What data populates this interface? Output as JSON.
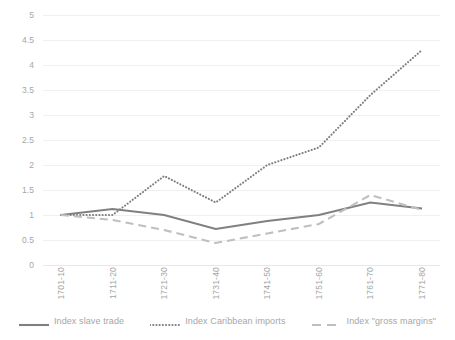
{
  "chart_data": {
    "type": "line",
    "title": "",
    "xlabel": "",
    "ylabel": "",
    "categories": [
      "1701-10",
      "1711-20",
      "1721-30",
      "1731-40",
      "1741-50",
      "1751-60",
      "1761-70",
      "1771-80"
    ],
    "ylim": [
      0,
      5
    ],
    "ytick_step": 0.5,
    "ytick_labels": [
      "5",
      "4.5",
      "4",
      "3.5",
      "3",
      "2.5",
      "2",
      "1.5",
      "1",
      "0.5",
      "0"
    ],
    "grid": true,
    "legend_position": "bottom",
    "series": [
      {
        "name": "Index slave trade",
        "style": "solid",
        "color": "#808080",
        "values": [
          1.0,
          1.12,
          1.0,
          0.72,
          0.88,
          1.0,
          1.25,
          1.13
        ]
      },
      {
        "name": "Index Caribbean imports",
        "style": "dotted",
        "color": "#7f7f7f",
        "values": [
          1.0,
          1.0,
          1.78,
          1.25,
          2.0,
          2.35,
          3.4,
          4.3
        ]
      },
      {
        "name": "Index \"gross margins\"",
        "style": "dashed",
        "color": "#bfbfbf",
        "values": [
          1.0,
          0.9,
          0.7,
          0.44,
          0.63,
          0.82,
          1.4,
          1.1
        ]
      }
    ]
  },
  "axis": {
    "y_tick_values": [
      5,
      4.5,
      4,
      3.5,
      3,
      2.5,
      2,
      1.5,
      1,
      0.5,
      0
    ]
  }
}
